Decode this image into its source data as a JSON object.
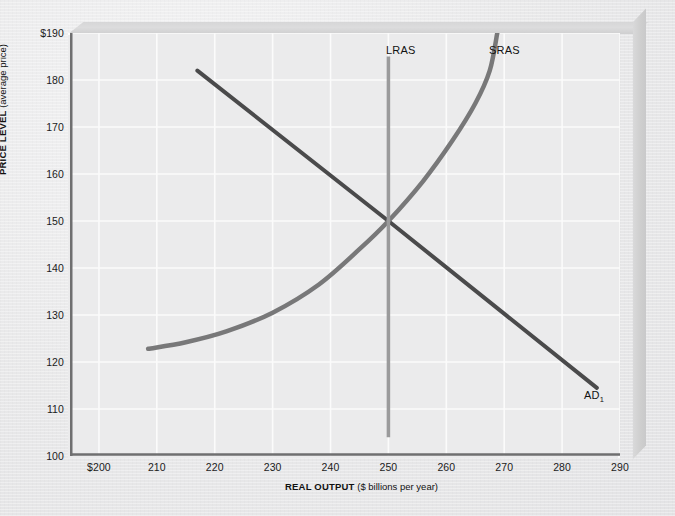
{
  "figure": {
    "title_visible": false,
    "background_color": "#ebebec",
    "gridline_color": "#fbfbfb",
    "axis_color": "#6f6f70"
  },
  "axes": {
    "y": {
      "title_bold": "PRICE LEVEL",
      "title_normal": " (average price)",
      "ticks": [
        "$190",
        "180",
        "170",
        "160",
        "150",
        "140",
        "130",
        "120",
        "110",
        "100"
      ],
      "values": [
        190,
        180,
        170,
        160,
        150,
        140,
        130,
        120,
        110,
        100
      ],
      "min": 100,
      "max": 190
    },
    "x": {
      "title_bold": "REAL OUTPUT",
      "title_normal": " ($ billions per year)",
      "ticks": [
        "$200",
        "210",
        "220",
        "230",
        "240",
        "250",
        "260",
        "270",
        "280",
        "290"
      ],
      "values": [
        200,
        210,
        220,
        230,
        240,
        250,
        260,
        270,
        280,
        290
      ],
      "min": 195,
      "max": 290
    }
  },
  "annotations": {
    "lras_label": "LRAS",
    "sras_label": "SRAS",
    "ad_label": "AD",
    "ad_subscript": "1"
  },
  "chart_data": {
    "type": "line",
    "title": "",
    "xlabel": "REAL OUTPUT ($ billions per year)",
    "ylabel": "PRICE LEVEL (average price)",
    "xlim": [
      195,
      290
    ],
    "ylim": [
      100,
      190
    ],
    "grid": true,
    "legend": "inline-curve-labels",
    "equilibrium": {
      "x": 250,
      "y": 150,
      "label": "macro equilibrium"
    },
    "series": [
      {
        "name": "AD1",
        "display_name": "AD₁",
        "type": "line",
        "color": "#4a4a4b",
        "width": 4,
        "points": [
          {
            "x": 217,
            "y": 182
          },
          {
            "x": 250,
            "y": 150
          },
          {
            "x": 286,
            "y": 114.5
          }
        ]
      },
      {
        "name": "SRAS",
        "display_name": "SRAS",
        "type": "curve",
        "color": "#787879",
        "width": 4.5,
        "points": [
          {
            "x": 208.5,
            "y": 122.8
          },
          {
            "x": 215,
            "y": 124.2
          },
          {
            "x": 222,
            "y": 126.5
          },
          {
            "x": 230,
            "y": 130.5
          },
          {
            "x": 238,
            "y": 136.5
          },
          {
            "x": 245,
            "y": 144
          },
          {
            "x": 250,
            "y": 150
          },
          {
            "x": 256,
            "y": 158.5
          },
          {
            "x": 261,
            "y": 167
          },
          {
            "x": 265,
            "y": 175
          },
          {
            "x": 267.5,
            "y": 182
          },
          {
            "x": 268.8,
            "y": 190
          }
        ]
      },
      {
        "name": "LRAS",
        "display_name": "LRAS",
        "type": "vline",
        "color": "#9a9a9b",
        "width": 3.5,
        "x": 250,
        "y_from": 104,
        "y_to": 185
      }
    ]
  }
}
